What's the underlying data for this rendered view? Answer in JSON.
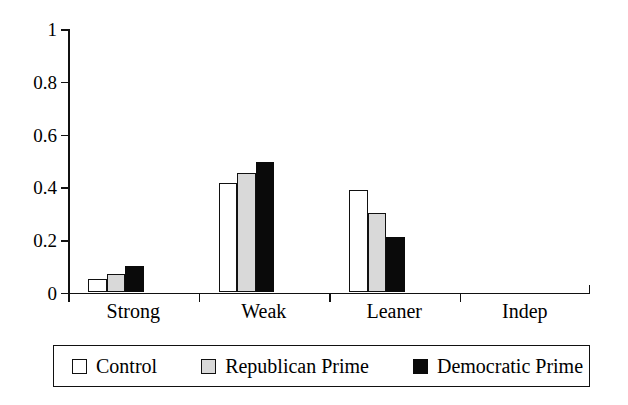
{
  "chart_data": {
    "type": "bar",
    "title": "",
    "subtitle": "",
    "xlabel": "",
    "ylabel": "",
    "categories": [
      "Strong",
      "Weak",
      "Leaner",
      "Indep"
    ],
    "series": [
      {
        "name": "Control",
        "color": "#ffffff",
        "values": [
          0.05,
          0.415,
          0.39,
          0.0
        ]
      },
      {
        "name": "Republican Prime",
        "color": "#d9d9d9",
        "values": [
          0.07,
          0.455,
          0.3,
          0.0
        ]
      },
      {
        "name": "Democratic Prime",
        "color": "#0a0a0a",
        "values": [
          0.1,
          0.495,
          0.21,
          0.0
        ]
      }
    ],
    "ylim": [
      0,
      1
    ],
    "yticks": [
      0,
      0.2,
      0.4,
      0.6,
      0.8,
      1
    ],
    "ytick_labels": [
      "0",
      "0.2",
      "0.4",
      "0.6",
      "0.8",
      "1"
    ],
    "grid": false,
    "legend_position": "bottom",
    "annotations": []
  },
  "legend": {
    "items": [
      {
        "label": "Control",
        "swatch": "white-square-icon"
      },
      {
        "label": "Republican Prime",
        "swatch": "gray-square-icon"
      },
      {
        "label": "Democratic Prime",
        "swatch": "black-square-icon"
      }
    ]
  }
}
